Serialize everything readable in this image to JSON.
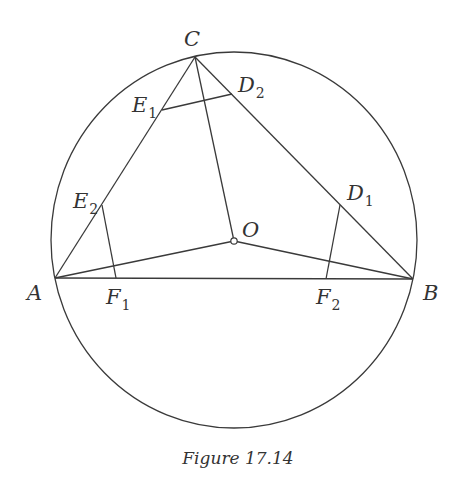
{
  "figure": {
    "caption": "Figure 17.14",
    "colors": {
      "stroke": "#3a3a3a",
      "text": "#333333",
      "background": "#ffffff"
    },
    "circle": {
      "cx": 234,
      "cy": 240,
      "rx": 183,
      "ry": 188
    },
    "points": {
      "A": {
        "label": "A",
        "x": 55,
        "y": 278
      },
      "B": {
        "label": "B",
        "x": 413,
        "y": 279
      },
      "C": {
        "label": "C",
        "x": 195,
        "y": 57
      },
      "O": {
        "label": "O",
        "x": 234,
        "y": 241
      },
      "D1": {
        "label": "D",
        "sub": "1",
        "x": 340,
        "y": 205
      },
      "D2": {
        "label": "D",
        "sub": "2",
        "x": 232,
        "y": 94
      },
      "E1": {
        "label": "E",
        "sub": "1",
        "x": 162,
        "y": 110
      },
      "E2": {
        "label": "E",
        "sub": "2",
        "x": 102,
        "y": 205
      },
      "F1": {
        "label": "F",
        "sub": "1",
        "x": 116,
        "y": 278
      },
      "F2": {
        "label": "F",
        "sub": "2",
        "x": 326,
        "y": 279
      }
    },
    "segments": [
      [
        "A",
        "B"
      ],
      [
        "B",
        "C"
      ],
      [
        "C",
        "A"
      ],
      [
        "O",
        "A"
      ],
      [
        "O",
        "B"
      ],
      [
        "O",
        "C"
      ],
      [
        "E1",
        "D2"
      ],
      [
        "E2",
        "F1"
      ],
      [
        "D1",
        "F2"
      ]
    ]
  }
}
